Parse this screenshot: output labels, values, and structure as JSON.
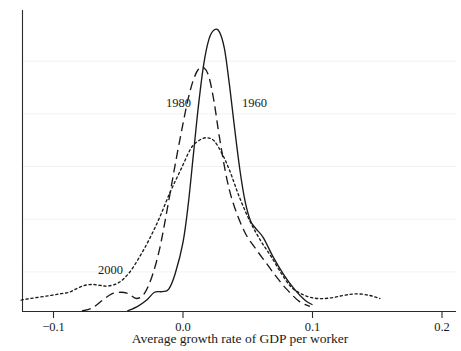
{
  "chart_data": {
    "type": "line",
    "title": "",
    "subtitle": "",
    "xlabel": "Average growth rate of GDP per worker",
    "ylabel": "",
    "xlim": [
      -0.13,
      0.205
    ],
    "ylim": [
      0,
      1.0
    ],
    "grid": true,
    "grid_axis": "y",
    "legend_position": "inline-annotations",
    "xticks": [
      -0.1,
      0.0,
      0.1,
      0.2
    ],
    "xticklabels": [
      "−0.1",
      "0.0",
      "0.1",
      "0.2"
    ],
    "yticks": [],
    "yticklabels": [],
    "series": [
      {
        "name": "1960",
        "style": "solid",
        "peak_x": 0.028,
        "peak_y": 0.9,
        "annotation": "1960",
        "x": [
          -0.043,
          -0.035,
          -0.028,
          -0.022,
          -0.016,
          -0.011,
          -0.006,
          0.0,
          0.004,
          0.008,
          0.012,
          0.016,
          0.02,
          0.024,
          0.028,
          0.032,
          0.036,
          0.04,
          0.044,
          0.048,
          0.052,
          0.056,
          0.062,
          0.07,
          0.078,
          0.086,
          0.094,
          0.1
        ],
        "y": [
          0.0,
          0.015,
          0.035,
          0.06,
          0.062,
          0.07,
          0.12,
          0.22,
          0.34,
          0.5,
          0.66,
          0.79,
          0.87,
          0.9,
          0.895,
          0.84,
          0.72,
          0.58,
          0.45,
          0.35,
          0.29,
          0.265,
          0.235,
          0.17,
          0.115,
          0.07,
          0.035,
          0.02
        ]
      },
      {
        "name": "1980",
        "style": "dashed",
        "peak_x": 0.014,
        "peak_y": 0.78,
        "annotation": "1980",
        "x": [
          -0.078,
          -0.07,
          -0.062,
          -0.055,
          -0.048,
          -0.042,
          -0.036,
          -0.03,
          -0.024,
          -0.018,
          -0.012,
          -0.006,
          0.0,
          0.004,
          0.008,
          0.012,
          0.016,
          0.02,
          0.024,
          0.028,
          0.034,
          0.04,
          0.048,
          0.056,
          0.064,
          0.072,
          0.08,
          0.09,
          0.098
        ],
        "y": [
          0.0,
          0.01,
          0.035,
          0.055,
          0.06,
          0.055,
          0.04,
          0.055,
          0.11,
          0.2,
          0.33,
          0.47,
          0.6,
          0.68,
          0.74,
          0.775,
          0.78,
          0.75,
          0.67,
          0.56,
          0.42,
          0.33,
          0.25,
          0.2,
          0.155,
          0.11,
          0.07,
          0.03,
          0.015
        ]
      },
      {
        "name": "2000",
        "style": "dotted",
        "peak_x": 0.018,
        "peak_y": 0.555,
        "annotation": "2000",
        "x": [
          -0.125,
          -0.118,
          -0.11,
          -0.102,
          -0.095,
          -0.088,
          -0.082,
          -0.076,
          -0.07,
          -0.064,
          -0.058,
          -0.05,
          -0.042,
          -0.034,
          -0.026,
          -0.018,
          -0.01,
          -0.002,
          0.006,
          0.012,
          0.018,
          0.024,
          0.03,
          0.036,
          0.044,
          0.052,
          0.06,
          0.068,
          0.076,
          0.084,
          0.094,
          0.104,
          0.114,
          0.124,
          0.134,
          0.144,
          0.152
        ],
        "y": [
          0.035,
          0.04,
          0.045,
          0.05,
          0.055,
          0.06,
          0.072,
          0.082,
          0.085,
          0.082,
          0.08,
          0.09,
          0.12,
          0.17,
          0.23,
          0.3,
          0.38,
          0.45,
          0.52,
          0.545,
          0.555,
          0.545,
          0.505,
          0.45,
          0.36,
          0.285,
          0.225,
          0.175,
          0.12,
          0.075,
          0.05,
          0.04,
          0.042,
          0.05,
          0.055,
          0.05,
          0.04
        ]
      }
    ],
    "annotations": [
      {
        "text": "1980",
        "x_px": 166,
        "y_px": 107
      },
      {
        "text": "1960",
        "x_px": 242,
        "y_px": 107
      },
      {
        "text": "2000",
        "x_px": 98,
        "y_px": 274
      }
    ]
  }
}
